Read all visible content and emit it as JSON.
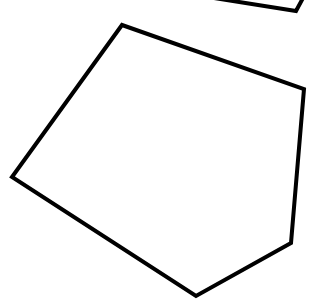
{
  "canvas": {
    "width": 319,
    "height": 301,
    "background": "#ffffff"
  },
  "stroke": {
    "color": "#000000",
    "width": 4
  },
  "shapes": {
    "pentagon": {
      "points": "122,25 304,89 291,243 196,296 12,177"
    },
    "partial_top": {
      "points": "214,-2 296,11 303,-2"
    }
  }
}
